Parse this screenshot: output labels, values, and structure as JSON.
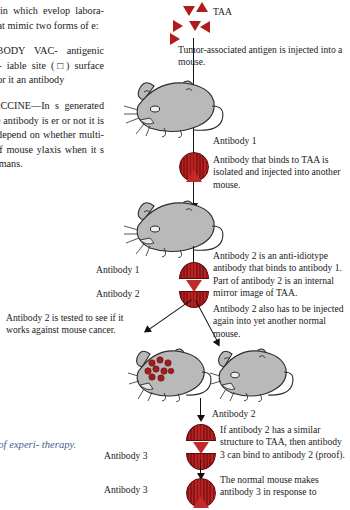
{
  "left_column": {
    "paragraphs": [
      "way in which evelop labora- ns that mimic two forms of e:",
      "TIBODY VAC- antigenic deter- iable site (□) surface site, or it an antibody",
      "VACCINE—In s generated by he antibody is er or not it is will depend on whether multi- uct of mouse ylaxis when it s in humans."
    ],
    "caption": "le of experi- therapy."
  },
  "diagram": {
    "taa_label": "TAA",
    "steps": [
      {
        "name": "step-1-text",
        "text": "Tumor-associated antigen is injected into a mouse."
      },
      {
        "name": "step-2-text",
        "text": "Antibody that binds to TAA is isolated and injected into another mouse."
      },
      {
        "name": "step-3-text",
        "text": "Antibody 2 is an anti-idiotype antibody that binds to antibody 1. Part of antibody 2 is an internal mirror image of TAA."
      },
      {
        "name": "step-4-text",
        "text": "Antibody 2 also has to be injected again into yet another normal mouse."
      },
      {
        "name": "step-5-text",
        "text": "If antibody 2 has a similar structure to TAA, then antibody 3 can bind to antibody 2 (proof)."
      },
      {
        "name": "step-6-text",
        "text": "The normal mouse makes antibody 3 in response to"
      }
    ],
    "test_text": "Antibody 2 is tested to see if it works against mouse cancer.",
    "labels": {
      "antibody_1_top": "Antibody 1",
      "antibody_1_pair": "Antibody 1",
      "antibody_2_pair": "Antibody 2",
      "antibody_2_lower": "Antibody 2",
      "antibody_3_upper": "Antibody 3",
      "antibody_3_lower": "Antibody 3"
    }
  },
  "colors": {
    "antigen_red": "#b01b1b",
    "antibody_red": "#9d1a1a",
    "mouse_gray": "#b9b9b9",
    "caption_blue": "#4a5c93",
    "ink": "#1a1a1a"
  }
}
